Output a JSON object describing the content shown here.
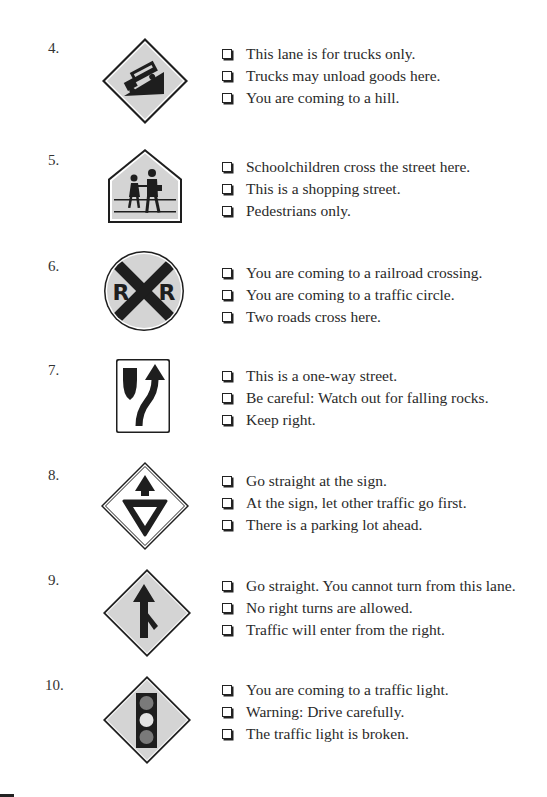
{
  "questions": [
    {
      "number": "4.",
      "sign": "truck-on-hill-warning-sign",
      "options": [
        "This lane is for trucks only.",
        "Trucks may unload goods here.",
        "You are coming to a hill."
      ]
    },
    {
      "number": "5.",
      "sign": "school-crossing-sign",
      "options": [
        "Schoolchildren cross the street here.",
        "This is a shopping street.",
        "Pedestrians only."
      ]
    },
    {
      "number": "6.",
      "sign": "railroad-crossing-sign",
      "sign_letters": [
        "R",
        "R"
      ],
      "options": [
        "You are coming to a railroad crossing.",
        "You are coming to a traffic circle.",
        "Two roads cross here."
      ]
    },
    {
      "number": "7.",
      "sign": "keep-right-sign",
      "options": [
        "This is a one-way street.",
        "Be careful: Watch out for falling rocks.",
        "Keep right."
      ]
    },
    {
      "number": "8.",
      "sign": "yield-ahead-sign",
      "options": [
        "Go straight at the sign.",
        "At the sign, let other traffic go first.",
        "There is a parking lot ahead."
      ]
    },
    {
      "number": "9.",
      "sign": "merge-from-right-sign",
      "options": [
        "Go straight. You cannot turn from this lane.",
        "No right turns are allowed.",
        "Traffic will enter from the right."
      ]
    },
    {
      "number": "10.",
      "sign": "traffic-light-ahead-sign",
      "options": [
        "You are coming to a traffic light.",
        "Warning: Drive carefully.",
        "The traffic light is broken."
      ]
    }
  ],
  "colors": {
    "sign_fill": "#d4d4d4",
    "sign_ink": "#1e1e1e",
    "text": "#2a2a2a"
  }
}
